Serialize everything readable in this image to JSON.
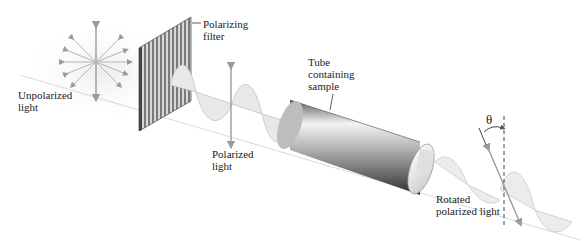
{
  "labels": {
    "unpolarized": "Unpolarized\nlight",
    "filter": "Polarizing\nfilter",
    "polarized": "Polarized\nlight",
    "tube": "Tube\ncontaining\nsample",
    "rotated": "Rotated\npolarized light",
    "theta": "θ"
  },
  "colors": {
    "arrow": "#9a9a9a",
    "wave_fill": "#e6e6e6",
    "tube_dark": "#3a3a3a",
    "tube_light": "#f2f2f2"
  }
}
